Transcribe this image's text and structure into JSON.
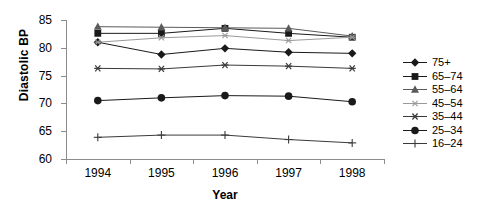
{
  "chart_data": {
    "type": "line",
    "title": "",
    "xlabel": "Year",
    "ylabel": "Diastolic BP",
    "categories": [
      "1994",
      "1995",
      "1996",
      "1997",
      "1998"
    ],
    "ylim": [
      60,
      85
    ],
    "yticks": [
      60,
      65,
      70,
      75,
      80,
      85
    ],
    "grid": false,
    "legend_position": "right",
    "series": [
      {
        "name": "75+",
        "marker": "diamond",
        "color": "#1a1a1a",
        "values": [
          81.0,
          78.8,
          79.9,
          79.2,
          79.0
        ]
      },
      {
        "name": "65-74",
        "marker": "square",
        "color": "#1a1a1a",
        "values": [
          82.6,
          82.6,
          83.5,
          82.6,
          81.9
        ]
      },
      {
        "name": "55-64",
        "marker": "triangle",
        "color": "#5a5a5a",
        "values": [
          83.8,
          83.7,
          83.6,
          83.5,
          82.1
        ]
      },
      {
        "name": "45-54",
        "marker": "x-small",
        "color": "#9a9a9a",
        "values": [
          81.0,
          81.8,
          82.2,
          81.3,
          81.9
        ]
      },
      {
        "name": "35-44",
        "marker": "asterisk",
        "color": "#3a3a3a",
        "values": [
          76.3,
          76.2,
          76.9,
          76.7,
          76.3
        ]
      },
      {
        "name": "25-34",
        "marker": "circle",
        "color": "#1a1a1a",
        "values": [
          70.5,
          71.0,
          71.4,
          71.3,
          70.3
        ]
      },
      {
        "name": "16-24",
        "marker": "plus",
        "color": "#3a3a3a",
        "values": [
          63.9,
          64.3,
          64.3,
          63.5,
          62.9
        ]
      }
    ]
  },
  "legend": {
    "items": [
      {
        "label": "75+"
      },
      {
        "label": "65–74"
      },
      {
        "label": "55–64"
      },
      {
        "label": "45–54"
      },
      {
        "label": "35–44"
      },
      {
        "label": "25–34"
      },
      {
        "label": "16–24"
      }
    ]
  },
  "axes": {
    "y_title": "Diastolic BP",
    "x_title": "Year",
    "y_tick_labels": [
      "85",
      "80",
      "75",
      "70",
      "65",
      "60"
    ],
    "x_tick_labels": [
      "1994",
      "1995",
      "1996",
      "1997",
      "1998"
    ]
  },
  "colors": {
    "axis": "#8c8c8c",
    "text": "#000000",
    "dark_series": "#1a1a1a",
    "mid_series": "#5a5a5a",
    "light_series": "#9a9a9a"
  }
}
